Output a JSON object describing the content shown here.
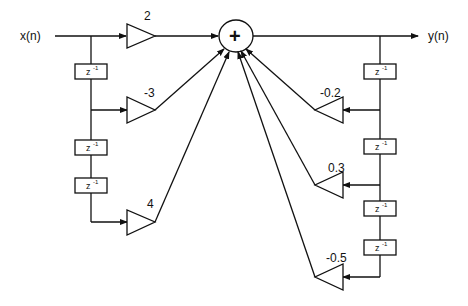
{
  "diagram": {
    "title": "",
    "type": "IIR direct-form signal flow graph",
    "input_label": "x(n)",
    "output_label": "y(n)",
    "summing_node": {
      "symbol": "+"
    },
    "delay_label": "z",
    "delay_exponent": "-1",
    "feedforward_gains": [
      "2",
      "-3",
      "4"
    ],
    "feedback_gains": [
      "-0.2",
      "0.3",
      "-0.5"
    ],
    "feedforward_delays_count": 3,
    "feedback_delays_count": 4,
    "colors": {
      "stroke": "#111111",
      "background": "#ffffff"
    }
  }
}
